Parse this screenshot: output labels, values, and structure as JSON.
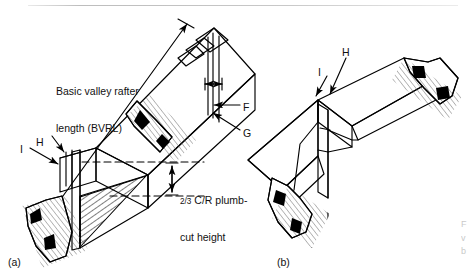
{
  "figure": {
    "type": "technical-line-drawing",
    "background_color": "#ffffff",
    "ink_color": "#000000",
    "panels": [
      {
        "id": "a",
        "caption": "(a)",
        "callouts": [
          {
            "key": "F",
            "label": "F",
            "arrow": "horizontal-left"
          },
          {
            "key": "G",
            "label": "G",
            "arrow": "diagonal-up-left"
          },
          {
            "key": "H",
            "label": "H",
            "arrow": "diagonal-down-right"
          },
          {
            "key": "I",
            "label": "I",
            "arrow": "diagonal-down-right"
          }
        ],
        "dimension_labels": [
          {
            "key": "bvrl",
            "line1": "Basic valley rafter",
            "line2": "length (BVRL)"
          },
          {
            "key": "plumb",
            "numerator": "2",
            "denominator": "3",
            "line1_tail": " C/R plumb-",
            "line2": "cut height"
          }
        ]
      },
      {
        "id": "b",
        "caption": "(b)",
        "callouts": [
          {
            "key": "H",
            "label": "H",
            "arrow": "diagonal-down-left"
          },
          {
            "key": "I",
            "label": "I",
            "arrow": "diagonal-down-right"
          }
        ]
      }
    ],
    "rule": {
      "present": true,
      "color": "#c8c8c8"
    }
  },
  "labels": {
    "bvrl_line1": "Basic valley rafter",
    "bvrl_line2": "length (BVRL)",
    "plumb_num": "2",
    "plumb_den": "3",
    "plumb_rest": " C/R plumb-",
    "plumb_line2": "cut height",
    "F": "F",
    "G": "G",
    "H": "H",
    "I": "I",
    "caption_a": "(a)",
    "caption_b": "(b)"
  }
}
